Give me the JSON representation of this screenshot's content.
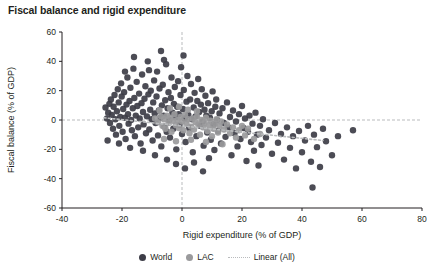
{
  "chart_data": {
    "type": "scatter",
    "title": "Fiscal balance and rigid expenditure",
    "xlabel": "Rigid expenditure (% of GDP)",
    "ylabel": "Fiscal balance (% of GDP)",
    "xlim": [
      -40,
      80
    ],
    "ylim": [
      -60,
      60
    ],
    "xticks": [
      -40,
      -20,
      0,
      20,
      40,
      60,
      80
    ],
    "yticks": [
      -60,
      -40,
      -20,
      0,
      20,
      40,
      60
    ],
    "grid": false,
    "zero_lines": true,
    "legend_position": "bottom",
    "colors": {
      "world": "#3d3d47",
      "lac": "#9a9a9c",
      "trend": "#b9bbbd",
      "axis": "#231f20",
      "zero_line": "#b9bbbd"
    },
    "series": [
      {
        "name": "World",
        "type": "scatter",
        "color": "#3d3d47",
        "points": [
          [
            -25.5,
            8.5
          ],
          [
            -25.0,
            1.0
          ],
          [
            -24.6,
            5.0
          ],
          [
            -24.2,
            11.0
          ],
          [
            -24.0,
            -2.0
          ],
          [
            -23.7,
            14.0
          ],
          [
            -23.4,
            3.5
          ],
          [
            -23.0,
            -6.0
          ],
          [
            -22.8,
            9.0
          ],
          [
            -22.5,
            17.0
          ],
          [
            -22.2,
            0.5
          ],
          [
            -22.0,
            -10.0
          ],
          [
            -21.7,
            6.0
          ],
          [
            -21.4,
            21.0
          ],
          [
            -21.1,
            12.0
          ],
          [
            -20.9,
            -4.0
          ],
          [
            -20.6,
            2.0
          ],
          [
            -20.3,
            25.0
          ],
          [
            -20.1,
            16.0
          ],
          [
            -19.8,
            -8.0
          ],
          [
            -19.6,
            7.5
          ],
          [
            -19.3,
            19.0
          ],
          [
            -19.0,
            1.5
          ],
          [
            -18.8,
            -13.0
          ],
          [
            -18.5,
            10.5
          ],
          [
            -18.2,
            29.0
          ],
          [
            -18.0,
            4.0
          ],
          [
            -17.8,
            -2.5
          ],
          [
            -17.5,
            13.0
          ],
          [
            -17.2,
            22.0
          ],
          [
            -17.0,
            0.0
          ],
          [
            -16.7,
            -7.0
          ],
          [
            -16.4,
            8.0
          ],
          [
            -16.2,
            35.0
          ],
          [
            -15.9,
            15.0
          ],
          [
            -15.7,
            -11.0
          ],
          [
            -15.4,
            3.0
          ],
          [
            -15.1,
            26.0
          ],
          [
            -14.9,
            9.5
          ],
          [
            -14.6,
            -5.0
          ],
          [
            -14.3,
            18.0
          ],
          [
            -14.1,
            1.0
          ],
          [
            -13.8,
            -16.0
          ],
          [
            -13.5,
            11.5
          ],
          [
            -13.3,
            31.0
          ],
          [
            -13.0,
            5.5
          ],
          [
            -12.8,
            -3.0
          ],
          [
            -12.5,
            14.5
          ],
          [
            -12.2,
            23.0
          ],
          [
            -12.0,
            -9.0
          ],
          [
            -11.7,
            2.5
          ],
          [
            -11.4,
            40.0
          ],
          [
            -11.2,
            17.5
          ],
          [
            -10.9,
            -6.5
          ],
          [
            -10.6,
            7.0
          ],
          [
            -10.4,
            20.0
          ],
          [
            -10.1,
            0.5
          ],
          [
            -9.8,
            -14.0
          ],
          [
            -9.6,
            12.0
          ],
          [
            -9.3,
            27.0
          ],
          [
            -9.1,
            4.5
          ],
          [
            -8.8,
            -2.0
          ],
          [
            -8.5,
            16.0
          ],
          [
            -8.3,
            33.0
          ],
          [
            -8.0,
            -10.5
          ],
          [
            -7.7,
            6.5
          ],
          [
            -7.5,
            21.5
          ],
          [
            -7.2,
            1.5
          ],
          [
            -6.9,
            -18.0
          ],
          [
            -6.7,
            10.0
          ],
          [
            -6.4,
            24.0
          ],
          [
            -6.1,
            3.0
          ],
          [
            -5.9,
            -4.5
          ],
          [
            -5.6,
            13.5
          ],
          [
            -5.3,
            38.0
          ],
          [
            -5.1,
            -8.0
          ],
          [
            -4.8,
            8.0
          ],
          [
            -4.5,
            19.0
          ],
          [
            -4.3,
            0.0
          ],
          [
            -4.0,
            -12.0
          ],
          [
            -3.7,
            15.0
          ],
          [
            -3.5,
            29.0
          ],
          [
            -3.2,
            5.0
          ],
          [
            -2.9,
            -6.0
          ],
          [
            -2.7,
            11.0
          ],
          [
            -2.4,
            22.5
          ],
          [
            -2.1,
            2.0
          ],
          [
            -1.9,
            -20.0
          ],
          [
            -1.6,
            9.0
          ],
          [
            -1.3,
            26.5
          ],
          [
            -1.1,
            4.0
          ],
          [
            -0.8,
            -3.5
          ],
          [
            -0.5,
            17.0
          ],
          [
            -0.3,
            36.0
          ],
          [
            0.0,
            -9.5
          ],
          [
            0.3,
            7.5
          ],
          [
            0.6,
            20.5
          ],
          [
            0.9,
            1.0
          ],
          [
            1.2,
            -15.0
          ],
          [
            1.5,
            12.5
          ],
          [
            1.8,
            30.0
          ],
          [
            2.1,
            3.5
          ],
          [
            2.4,
            -5.5
          ],
          [
            2.7,
            14.0
          ],
          [
            3.0,
            24.5
          ],
          [
            3.3,
            0.5
          ],
          [
            3.6,
            -22.0
          ],
          [
            3.9,
            8.5
          ],
          [
            4.2,
            18.5
          ],
          [
            4.5,
            2.5
          ],
          [
            4.8,
            -11.0
          ],
          [
            5.1,
            13.0
          ],
          [
            5.4,
            28.0
          ],
          [
            5.7,
            5.5
          ],
          [
            6.0,
            -4.0
          ],
          [
            6.3,
            10.5
          ],
          [
            6.6,
            21.0
          ],
          [
            6.9,
            -1.0
          ],
          [
            7.2,
            -17.5
          ],
          [
            7.5,
            7.0
          ],
          [
            7.8,
            16.5
          ],
          [
            8.1,
            3.0
          ],
          [
            8.4,
            -8.5
          ],
          [
            8.7,
            11.5
          ],
          [
            9.0,
            -26.0
          ],
          [
            9.3,
            1.5
          ],
          [
            9.6,
            -13.5
          ],
          [
            9.9,
            6.0
          ],
          [
            10.2,
            19.5
          ],
          [
            10.5,
            -3.0
          ],
          [
            10.8,
            -20.5
          ],
          [
            11.1,
            9.0
          ],
          [
            11.4,
            14.0
          ],
          [
            11.7,
            0.0
          ],
          [
            12.0,
            -7.5
          ],
          [
            12.5,
            4.5
          ],
          [
            13.0,
            -16.0
          ],
          [
            13.5,
            8.0
          ],
          [
            14.0,
            -2.0
          ],
          [
            14.5,
            -11.5
          ],
          [
            15.0,
            12.0
          ],
          [
            15.5,
            -5.0
          ],
          [
            16.0,
            2.0
          ],
          [
            16.5,
            -24.0
          ],
          [
            17.0,
            6.5
          ],
          [
            17.5,
            -9.0
          ],
          [
            18.0,
            -1.0
          ],
          [
            18.5,
            -18.0
          ],
          [
            19.0,
            4.0
          ],
          [
            19.5,
            -13.0
          ],
          [
            20.0,
            9.5
          ],
          [
            20.5,
            -5.5
          ],
          [
            21.0,
            1.0
          ],
          [
            21.5,
            -28.0
          ],
          [
            22.0,
            -8.0
          ],
          [
            22.5,
            3.0
          ],
          [
            23.0,
            -15.0
          ],
          [
            23.5,
            -2.5
          ],
          [
            24.0,
            -21.0
          ],
          [
            24.5,
            5.0
          ],
          [
            25.0,
            -10.0
          ],
          [
            25.5,
            -31.0
          ],
          [
            26.0,
            -4.0
          ],
          [
            26.5,
            -17.0
          ],
          [
            27.0,
            0.5
          ],
          [
            28.0,
            -12.0
          ],
          [
            29.0,
            -7.0
          ],
          [
            30.0,
            -23.0
          ],
          [
            31.0,
            -2.0
          ],
          [
            32.0,
            -15.5
          ],
          [
            33.0,
            -9.5
          ],
          [
            34.0,
            -27.0
          ],
          [
            35.0,
            -5.0
          ],
          [
            36.0,
            -19.0
          ],
          [
            37.0,
            -11.0
          ],
          [
            38.0,
            -33.0
          ],
          [
            39.0,
            -7.5
          ],
          [
            40.0,
            -22.0
          ],
          [
            41.0,
            -14.0
          ],
          [
            42.0,
            -4.0
          ],
          [
            43.0,
            -28.5
          ],
          [
            43.5,
            -46.0
          ],
          [
            44.0,
            -10.0
          ],
          [
            45.0,
            -18.5
          ],
          [
            46.0,
            -32.0
          ],
          [
            47.0,
            -6.0
          ],
          [
            48.0,
            -14.5
          ],
          [
            50.0,
            -24.0
          ],
          [
            52.0,
            -11.0
          ],
          [
            57.0,
            -7.0
          ],
          [
            -24.8,
            -14.0
          ],
          [
            -21.0,
            -16.0
          ],
          [
            -17.3,
            -19.0
          ],
          [
            -13.0,
            -21.0
          ],
          [
            -9.0,
            -24.0
          ],
          [
            -5.0,
            -27.0
          ],
          [
            -2.0,
            -30.0
          ],
          [
            1.0,
            -33.0
          ],
          [
            4.0,
            -29.0
          ],
          [
            7.0,
            -35.0
          ],
          [
            -19.0,
            33.0
          ],
          [
            -16.0,
            43.0
          ],
          [
            -11.0,
            34.0
          ],
          [
            -6.0,
            41.0
          ],
          [
            0.5,
            44.0
          ],
          [
            -7.0,
            47.0
          ]
        ]
      },
      {
        "name": "LAC",
        "type": "scatter",
        "color": "#9a9a9c",
        "points": [
          [
            -9.0,
            1.0
          ],
          [
            -8.0,
            -1.5
          ],
          [
            -7.0,
            2.5
          ],
          [
            -6.5,
            -4.0
          ],
          [
            -6.0,
            0.5
          ],
          [
            -5.5,
            -6.0
          ],
          [
            -5.0,
            3.0
          ],
          [
            -4.5,
            -2.0
          ],
          [
            -4.0,
            1.5
          ],
          [
            -3.5,
            -8.0
          ],
          [
            -3.0,
            -0.5
          ],
          [
            -2.5,
            4.0
          ],
          [
            -2.0,
            -3.5
          ],
          [
            -1.5,
            0.0
          ],
          [
            -1.0,
            -5.5
          ],
          [
            -0.5,
            2.0
          ],
          [
            0.0,
            -1.0
          ],
          [
            0.5,
            -7.0
          ],
          [
            1.0,
            3.5
          ],
          [
            1.5,
            -2.5
          ],
          [
            2.0,
            0.5
          ],
          [
            2.5,
            -9.0
          ],
          [
            3.0,
            -4.5
          ],
          [
            3.5,
            1.0
          ],
          [
            4.0,
            -6.5
          ],
          [
            4.5,
            -1.5
          ],
          [
            5.0,
            2.5
          ],
          [
            5.5,
            -3.0
          ],
          [
            6.0,
            -10.0
          ],
          [
            6.5,
            0.0
          ],
          [
            7.0,
            -5.0
          ],
          [
            7.5,
            -2.0
          ],
          [
            8.0,
            1.5
          ],
          [
            8.5,
            -7.5
          ],
          [
            9.0,
            -3.5
          ],
          [
            9.5,
            -0.5
          ],
          [
            10.0,
            -11.0
          ],
          [
            10.5,
            -6.0
          ],
          [
            11.0,
            -2.5
          ],
          [
            11.5,
            0.5
          ],
          [
            12.0,
            -8.5
          ],
          [
            12.5,
            -4.0
          ],
          [
            13.0,
            -1.0
          ],
          [
            14.0,
            -6.5
          ],
          [
            15.0,
            -3.0
          ],
          [
            16.0,
            -9.0
          ],
          [
            17.0,
            -5.0
          ],
          [
            18.0,
            -12.0
          ],
          [
            19.0,
            -7.0
          ],
          [
            20.0,
            -4.0
          ],
          [
            21.0,
            -10.5
          ],
          [
            22.0,
            -6.0
          ],
          [
            24.0,
            -13.0
          ],
          [
            26.0,
            -9.5
          ],
          [
            -4.0,
            8.0
          ],
          [
            -1.0,
            9.0
          ],
          [
            2.0,
            7.0
          ],
          [
            5.0,
            6.0
          ],
          [
            -7.5,
            6.5
          ],
          [
            -6.0,
            -13.0
          ],
          [
            -2.0,
            -14.5
          ],
          [
            3.0,
            -13.5
          ],
          [
            8.0,
            -15.0
          ],
          [
            13.5,
            -16.5
          ]
        ]
      },
      {
        "name": "Linear (All)",
        "type": "line",
        "color": "#b9bbbd",
        "style": "dotted",
        "endpoints": [
          [
            -26.0,
            1.5
          ],
          [
            47.0,
            -14.0
          ]
        ]
      }
    ],
    "legend": [
      {
        "label": "World",
        "marker": "dot",
        "color": "#3d3d47"
      },
      {
        "label": "LAC",
        "marker": "dot",
        "color": "#9a9a9c"
      },
      {
        "label": "Linear (All)",
        "marker": "dotted-line",
        "color": "#b9bbbd"
      }
    ]
  }
}
